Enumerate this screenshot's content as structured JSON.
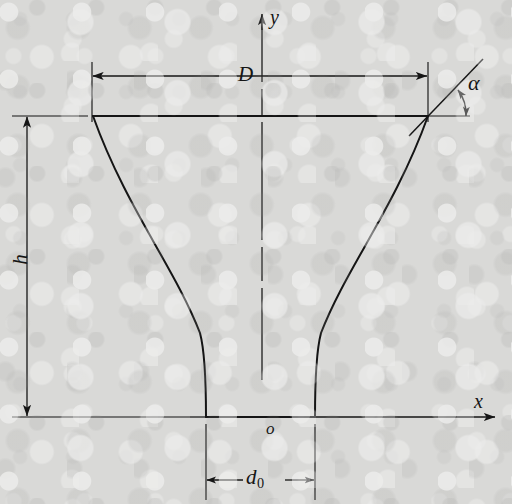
{
  "figure": {
    "kind": "engineering-line-diagram",
    "background_color": "#d9d9d7",
    "line_color": "#151515",
    "labels": {
      "y_axis": "y",
      "x_axis": "x",
      "origin": "o",
      "top_width": "D",
      "height": "h",
      "throat_diameter_symbol": "d",
      "throat_diameter_subscript": "0",
      "flare_angle": "α"
    }
  },
  "geometry": {
    "axes": {
      "origin_px": [
        262,
        417
      ],
      "y_axis": {
        "x": 262,
        "y_top": 13,
        "y_bottom": 440,
        "arrow": "up",
        "style": "chain-dash"
      },
      "x_axis": {
        "y": 417,
        "x_left": 190,
        "x_right": 496,
        "arrow": "right",
        "style": "solid"
      }
    },
    "profile": {
      "top_y": 116,
      "bottom_y": 417,
      "top_left_x": 93,
      "top_right_x": 428,
      "throat_left_x": 206,
      "throat_right_x": 315,
      "curve_type": "bell-flare",
      "left_control": [
        128,
        330
      ],
      "right_control": [
        393,
        330
      ]
    },
    "dimension_D": {
      "y": 76,
      "x_from": 92,
      "x_to": 428,
      "ext_left_x": 92,
      "ext_right_x": 428,
      "ext_top_y": 62,
      "ext_bottom_y": 122,
      "label_x": 245,
      "label_y": 65
    },
    "dimension_h": {
      "x": 27,
      "y_from": 116,
      "y_to": 417,
      "ext_top_y": 116,
      "ext_bottom_y": 417,
      "ext_left_x": 12,
      "ext_right_x": 88,
      "label_x": 22,
      "label_y": 258
    },
    "dimension_d0": {
      "y": 480,
      "x_from": 206,
      "x_to": 315,
      "ext_top_y": 424,
      "ext_bottom_y": 500,
      "label_x": 247,
      "label_y": 468
    },
    "angle_alpha": {
      "vertex_px": [
        428,
        116
      ],
      "ray_end_px": [
        482,
        60
      ],
      "arc_start_deg": 45,
      "arc_end_deg": 0,
      "arc_radius": 36,
      "label_x": 470,
      "label_y": 76
    }
  },
  "text_items": [
    {
      "name": "y-axis-label",
      "text": "y",
      "x": 270,
      "y": 12,
      "size": 19,
      "italic": true
    },
    {
      "name": "x-axis-label",
      "text": "x",
      "x": 473,
      "y": 392,
      "size": 19,
      "italic": true
    },
    {
      "name": "origin-label",
      "text": "o",
      "x": 267,
      "y": 421,
      "size": 17,
      "italic": true
    },
    {
      "name": "D-label",
      "text": "D",
      "x": 238,
      "y": 64,
      "size": 20,
      "italic": true
    },
    {
      "name": "h-label",
      "text": "h",
      "x": 16,
      "y": 250,
      "size": 20,
      "italic": true
    },
    {
      "name": "alpha-label",
      "text": "α",
      "x": 468,
      "y": 76,
      "size": 21,
      "italic": true
    }
  ]
}
